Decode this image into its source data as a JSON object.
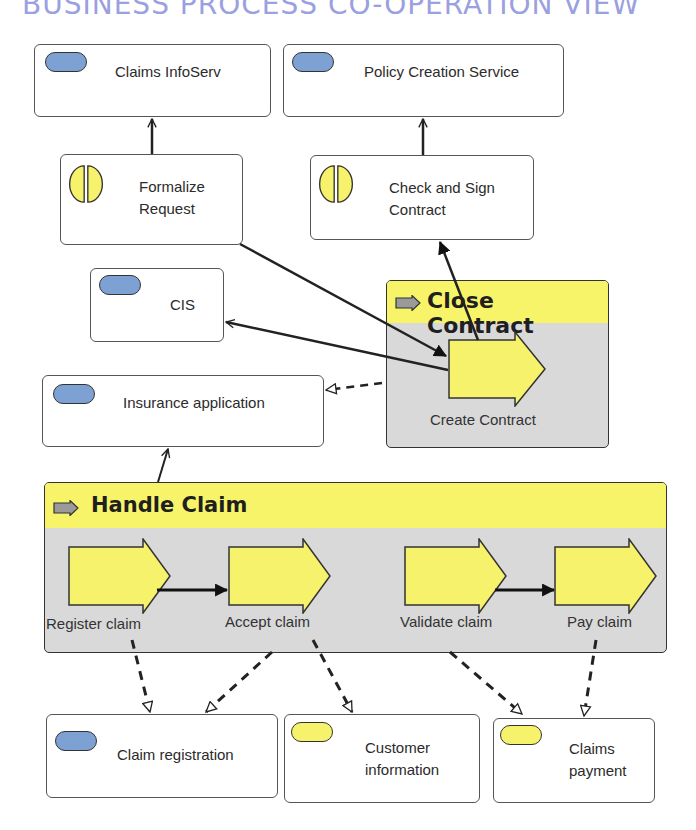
{
  "title": "BUSINESS PROCESS CO-OPERATION VIEW",
  "colors": {
    "title": "#9aa0e0",
    "application_service": "#7ea1d3",
    "business_object": "#f7f26b",
    "process_header": "#f7f46a",
    "process_body": "#d9d9d9",
    "step_fill": "#f7f26b"
  },
  "services": [
    {
      "id": "claims-infoserv",
      "label": "Claims InfoServ",
      "type": "application-service"
    },
    {
      "id": "policy-creation-service",
      "label": "Policy Creation Service",
      "type": "application-service"
    },
    {
      "id": "cis",
      "label": "CIS",
      "type": "application-service"
    },
    {
      "id": "insurance-application",
      "label": "Insurance application",
      "type": "application-service"
    }
  ],
  "interactions": [
    {
      "id": "formalize-request",
      "line1": "Formalize",
      "line2": "Request"
    },
    {
      "id": "check-and-sign-contract",
      "line1": "Check and Sign",
      "line2": "Contract"
    }
  ],
  "processes": {
    "close_contract": {
      "title": "Close Contract",
      "steps": [
        {
          "label": "Create Contract"
        }
      ]
    },
    "handle_claim": {
      "title": "Handle Claim",
      "steps": [
        {
          "label": "Register claim"
        },
        {
          "label": "Accept claim"
        },
        {
          "label": "Validate claim"
        },
        {
          "label": "Pay claim"
        }
      ]
    }
  },
  "data_objects": [
    {
      "id": "claim-registration",
      "label": "Claim registration",
      "color": "blue"
    },
    {
      "id": "customer-information",
      "line1": "Customer",
      "line2": "information",
      "color": "yellow"
    },
    {
      "id": "claims-payment",
      "line1": "Claims",
      "line2": "payment",
      "color": "yellow"
    }
  ]
}
